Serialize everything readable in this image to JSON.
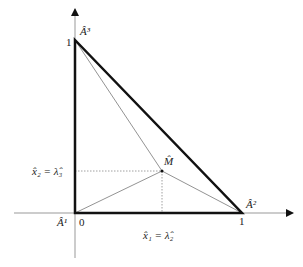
{
  "diagram": {
    "type": "simplex-triangle",
    "colors": {
      "triangle": "#111111",
      "axis": "#888888",
      "inner": "#777777",
      "guide": "#888888"
    },
    "vertices": {
      "A1": {
        "label": "Â¹",
        "coord": [
          0,
          0
        ]
      },
      "A2": {
        "label": "Â²",
        "coord": [
          1,
          0
        ]
      },
      "A3": {
        "label": "Â³",
        "coord": [
          0,
          1
        ]
      },
      "M": {
        "label": "M̂",
        "coord": [
          0.52,
          0.24
        ]
      }
    },
    "ticks": {
      "x_origin": "0",
      "x_one": "1",
      "y_one": "1"
    },
    "projections": {
      "x1": "x̂₁ = λ̂₂",
      "x2": "x̂₂ = λ̂₃"
    }
  }
}
